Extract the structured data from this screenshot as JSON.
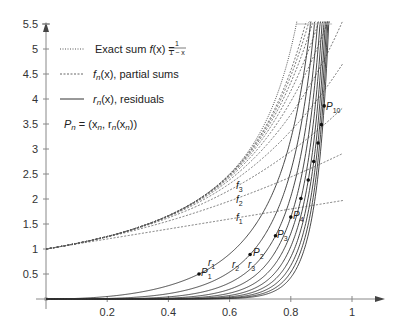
{
  "chart_data": {
    "type": "line",
    "title": "",
    "xlabel": "",
    "ylabel": "",
    "xlim": [
      0,
      1.0
    ],
    "ylim": [
      0,
      5.5
    ],
    "grid": false,
    "x_ticks": [
      0.2,
      0.4,
      0.6,
      0.8,
      1
    ],
    "x_tick_labels": [
      "0.2",
      "0.4",
      "0.6",
      "0.8",
      "1"
    ],
    "y_ticks": [
      0.5,
      1,
      1.5,
      2,
      2.5,
      3,
      3.5,
      4,
      4.5,
      5,
      5.5
    ],
    "y_tick_labels": [
      "0.5",
      "1",
      "1.5",
      "2",
      "2.5",
      "3",
      "3.5",
      "4",
      "4.5",
      "5",
      "5.5"
    ],
    "legend": {
      "position": "upper-left",
      "entries": [
        {
          "style": "dotted",
          "label": "Exact sum f(x) = 1/(1−x)"
        },
        {
          "style": "dashed",
          "label": "f_n(x), partial sums"
        },
        {
          "style": "solid",
          "label": "r_n(x), residuals"
        }
      ],
      "note": "P_n = (x_n, r_n(x_n))"
    },
    "series": [
      {
        "name": "Exact sum f(x)",
        "formula": "1/(1-x)",
        "style": "dotted"
      },
      {
        "name": "f_n(x), partial sums",
        "formula": "(1-x^(n+1))/(1-x)",
        "n": [
          1,
          2,
          3,
          4,
          5,
          6,
          7,
          8,
          9,
          10
        ],
        "style": "dashed"
      },
      {
        "name": "r_n(x), residuals",
        "formula": "x^(n+1)/(1-x)",
        "n": [
          1,
          2,
          3,
          4,
          5,
          6,
          7,
          8,
          9,
          10
        ],
        "style": "solid"
      }
    ],
    "points": [
      {
        "label": "P1",
        "x": 0.5,
        "y": 0.5
      },
      {
        "label": "P2",
        "x": 0.667,
        "y": 0.889
      },
      {
        "label": "P3",
        "x": 0.75,
        "y": 1.266
      },
      {
        "label": "P4",
        "x": 0.8,
        "y": 1.638
      },
      {
        "label": "P5",
        "x": 0.833,
        "y": 2.009
      },
      {
        "label": "P6",
        "x": 0.857,
        "y": 2.38
      },
      {
        "label": "P7",
        "x": 0.875,
        "y": 2.75
      },
      {
        "label": "P8",
        "x": 0.889,
        "y": 3.121
      },
      {
        "label": "P9",
        "x": 0.9,
        "y": 3.487
      },
      {
        "label": "P10",
        "x": 0.909,
        "y": 3.862
      }
    ],
    "annotations": [
      {
        "text": "f1",
        "x": 0.62,
        "y": 1.63
      },
      {
        "text": "f2",
        "x": 0.62,
        "y": 2.04
      },
      {
        "text": "f3",
        "x": 0.62,
        "y": 2.3
      },
      {
        "text": "r1",
        "x": 0.53,
        "y": 0.62
      },
      {
        "text": "r2",
        "x": 0.6,
        "y": 0.65
      },
      {
        "text": "r3",
        "x": 0.66,
        "y": 0.62
      },
      {
        "text": "P1",
        "x": 0.5,
        "y": 0.5
      },
      {
        "text": "P2",
        "x": 0.667,
        "y": 0.889
      },
      {
        "text": "P3",
        "x": 0.75,
        "y": 1.266
      },
      {
        "text": "P4",
        "x": 0.8,
        "y": 1.638
      },
      {
        "text": "P10",
        "x": 0.909,
        "y": 3.862
      }
    ]
  },
  "legend_text": {
    "exact": "Exact sum ",
    "exact_f": "f",
    "exact_x": "(x) = ",
    "frac_num": "1",
    "frac_den": "1 − x",
    "partial_f": "f",
    "partial_n": "n",
    "partial_rest": "(x), partial sums",
    "resid_r": "r",
    "resid_n": "n",
    "resid_rest": "(x), residuals",
    "point_note": "P",
    "point_note_rest": " = (x",
    "point_note_rest2": ", r",
    "point_note_rest3": "(x",
    "point_note_rest4": "))"
  }
}
